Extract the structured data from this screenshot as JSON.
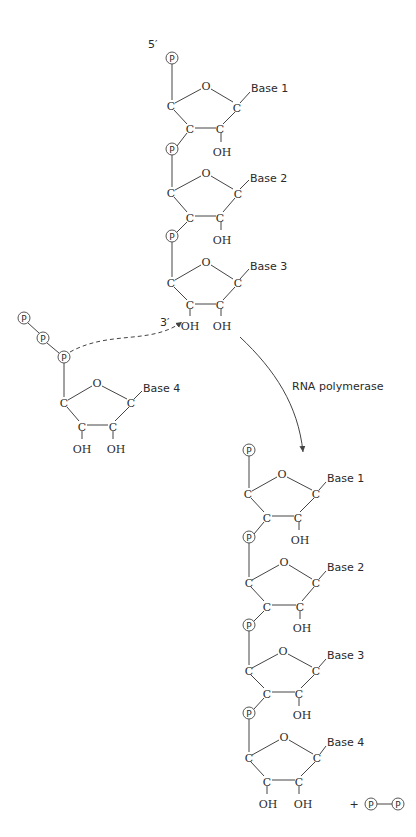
{
  "diagram": {
    "labels": {
      "five_prime": "5′",
      "three_prime": "3′",
      "enzyme": "RNA polymerase",
      "plus": "+",
      "phosphate": "P",
      "oxygen": "O",
      "carbon": "C",
      "hydroxyl": "OH"
    },
    "reactant_chain": {
      "nucleotides": [
        {
          "base": "Base 1"
        },
        {
          "base": "Base 2"
        },
        {
          "base": "Base 3"
        }
      ]
    },
    "incoming_nucleotide": {
      "base": "Base 4",
      "phosphates": 3
    },
    "product_chain": {
      "nucleotides": [
        {
          "base": "Base 1"
        },
        {
          "base": "Base 2"
        },
        {
          "base": "Base 3"
        },
        {
          "base": "Base 4"
        }
      ]
    },
    "byproduct": "pyrophosphate (P—P)",
    "colors": {
      "line": "#444444",
      "text": "#2a2a2a",
      "background": "#ffffff"
    }
  }
}
